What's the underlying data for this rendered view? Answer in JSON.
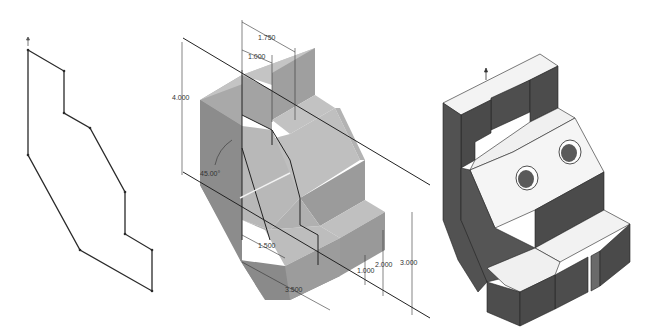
{
  "figures": [
    {
      "name": "sketch-profile",
      "description": "2D sketch profile outline"
    },
    {
      "name": "dimensioned-extrusion",
      "description": "Shaded 3D part with dimensions"
    },
    {
      "name": "finished-part",
      "description": "Shaded 3D part with two holes and slots"
    }
  ],
  "dimensions": {
    "top_width_outer": "1.750",
    "top_width_inner": "1.000",
    "height_total": "4.000",
    "angle": "45.00°",
    "bottom_width_inner": "1.500",
    "bottom_width_outer": "3.500",
    "step_height_1": "1.000",
    "step_height_2": "2.000",
    "step_height_3": "3.000"
  },
  "colors": {
    "face_top": "#bdbdbd",
    "face_front": "#9a9a9a",
    "face_side": "#7e7e7e",
    "dark_side": "#4a4a4a",
    "light_top": "#f4f4f4",
    "line": "#222222"
  }
}
